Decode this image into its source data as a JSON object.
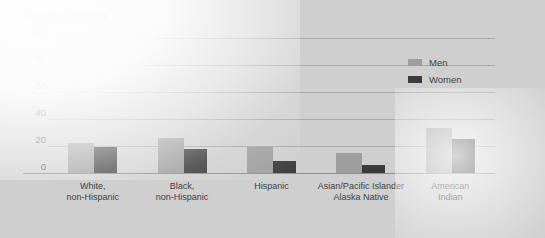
{
  "chart_data": {
    "type": "bar",
    "title": "Percent of persons",
    "xlabel": "",
    "ylabel": "Percent of persons",
    "ylim": [
      0,
      100
    ],
    "yticks": [
      0,
      20,
      40,
      60,
      80,
      100
    ],
    "grid": true,
    "legend_position": "top-right",
    "categories": [
      "White,\nnon-Hispanic",
      "Black,\nnon-Hispanic",
      "Hispanic",
      "Asian/Pacific Islander\nAlaska Native",
      "American\nIndian"
    ],
    "series": [
      {
        "name": "Men",
        "color": "#9e9e9e",
        "values": [
          22,
          26,
          19,
          15,
          33
        ]
      },
      {
        "name": "Women",
        "color": "#3b3b3b",
        "values": [
          19,
          18,
          9,
          6,
          25
        ]
      }
    ]
  },
  "axis": {
    "ticks": [
      {
        "label": "100",
        "value": 100
      },
      {
        "label": "80",
        "value": 80
      },
      {
        "label": "60",
        "value": 60
      },
      {
        "label": "40",
        "value": 40
      },
      {
        "label": "20",
        "value": 20
      },
      {
        "label": "0",
        "value": 0
      }
    ]
  },
  "xlabels": [
    {
      "line1": "White,",
      "line2": "non-Hispanic"
    },
    {
      "line1": "Black,",
      "line2": "non-Hispanic"
    },
    {
      "line1": "Hispanic",
      "line2": ""
    },
    {
      "line1": "Asian/Pacific Islander",
      "line2": "Alaska Native"
    },
    {
      "line1": "American",
      "line2": "Indian"
    }
  ],
  "legend": {
    "items": [
      {
        "label": "Men",
        "color": "#9e9e9e"
      },
      {
        "label": "Women",
        "color": "#3b3b3b"
      }
    ]
  },
  "colors": {
    "background": "#cfcfcf",
    "gridline": "#a9a9a9",
    "axis": "#8f8f8f",
    "men_bar": "#9e9e9e",
    "women_bar": "#3b3b3b",
    "text": "#3f3f3f"
  }
}
